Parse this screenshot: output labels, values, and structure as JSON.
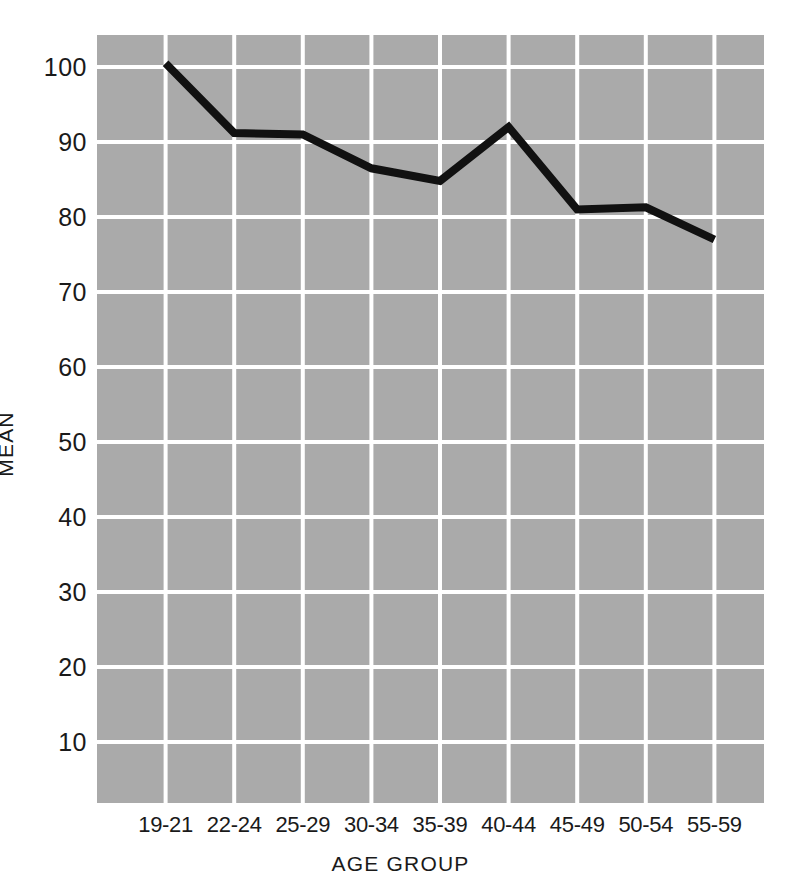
{
  "chart_data": {
    "type": "line",
    "title": "",
    "xlabel": "AGE GROUP",
    "ylabel": "MEAN",
    "categories": [
      "19-21",
      "22-24",
      "25-29",
      "30-34",
      "35-39",
      "40-44",
      "45-49",
      "50-54",
      "55-59"
    ],
    "values": [
      100.5,
      91.2,
      91.0,
      86.5,
      84.8,
      92.0,
      81.0,
      81.3,
      77.0
    ],
    "series": [
      {
        "name": "MEAN",
        "values": [
          100.5,
          91.2,
          91.0,
          86.5,
          84.8,
          92.0,
          81.0,
          81.3,
          77.0
        ]
      }
    ],
    "ylim": [
      0,
      103
    ],
    "yticks": [
      10,
      20,
      30,
      40,
      50,
      60,
      70,
      80,
      90,
      100
    ],
    "ytick_labels": [
      "10",
      "20",
      "30",
      "40",
      "50",
      "60",
      "70",
      "80",
      "90",
      "100"
    ],
    "grid": true,
    "grid_color": "#ffffff",
    "plot_background": "#aaaaaa",
    "line_color": "#111111",
    "legend": "none",
    "legend_position": "none"
  },
  "axes": {
    "y_title": "MEAN",
    "x_title": "AGE GROUP"
  }
}
